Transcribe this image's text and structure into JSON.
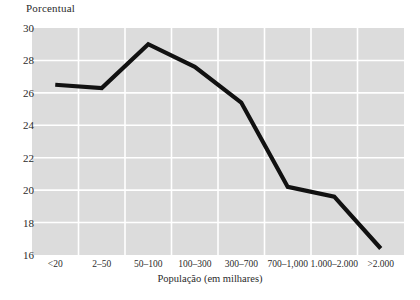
{
  "chart_data": {
    "type": "line",
    "title": "",
    "ylabel": "Porcentual",
    "xlabel": "População (em milhares)",
    "categories": [
      "<20",
      "2–50",
      "50–100",
      "100–300",
      "300–700",
      "700–1,000",
      "1.000–2.000",
      ">2.000"
    ],
    "values": [
      26.5,
      26.3,
      29.0,
      27.6,
      25.4,
      20.2,
      19.6,
      16.4
    ],
    "ylim": [
      16,
      30
    ],
    "yticks": [
      30,
      28,
      26,
      24,
      22,
      20,
      18,
      16
    ],
    "ytick_labels": [
      "30",
      "28",
      "26",
      "24",
      "22",
      "20",
      "18",
      "16"
    ],
    "grid": true,
    "legend": false,
    "series": [
      {
        "name": "Porcentual",
        "values": [
          26.5,
          26.3,
          29.0,
          27.6,
          25.4,
          20.2,
          19.6,
          16.4
        ],
        "color": "#111111"
      }
    ],
    "plot_background": "#dcdcdc",
    "gridline_color": "#ffffff",
    "line_color": "#111111",
    "line_width": 4.2
  },
  "figure": {
    "y_axis_title": "Porcentual",
    "x_axis_title": "População (em milhares)",
    "caption_partial": ""
  }
}
